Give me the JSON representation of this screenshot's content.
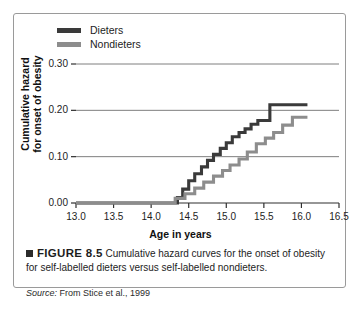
{
  "figure": {
    "number_label": "FIGURE 8.5",
    "caption_text": "Cumulative hazard curves for the onset of obesity for self-labelled dieters versus self-labelled nondieters.",
    "source_word": "Source:",
    "source_text": "From Stice et al., 1999",
    "marker_icon": "filled-square-icon"
  },
  "chart_data": {
    "type": "line",
    "title": "",
    "xlabel": "Age in years",
    "ylabel": "Cumulative hazard for onset of obesity",
    "ylabel_line1": "Cumulative hazard",
    "ylabel_line2": "for onset of obesity",
    "xlim": [
      13.0,
      16.5
    ],
    "ylim": [
      0.0,
      0.3
    ],
    "xticks": [
      13.0,
      13.5,
      14.0,
      14.5,
      15.0,
      15.5,
      16.0,
      16.5
    ],
    "xtick_labels": [
      "13.0",
      "13.5",
      "14.0",
      "14.5",
      "15.0",
      "15.5",
      "16.0",
      "16.5"
    ],
    "yticks": [
      0.0,
      0.1,
      0.2,
      0.3
    ],
    "ytick_labels": [
      "0.00",
      "0.10",
      "0.20",
      "0.30"
    ],
    "grid": "horizontal",
    "legend_position": "above-left",
    "step_style": "post",
    "series": [
      {
        "name": "Dieters",
        "color": "#3a3a3a",
        "x": [
          13.0,
          14.25,
          14.35,
          14.42,
          14.5,
          14.58,
          14.67,
          14.75,
          14.83,
          14.92,
          15.0,
          15.08,
          15.17,
          15.25,
          15.33,
          15.42,
          15.58,
          16.08
        ],
        "y": [
          0.0,
          0.0,
          0.012,
          0.03,
          0.048,
          0.063,
          0.078,
          0.092,
          0.105,
          0.118,
          0.13,
          0.143,
          0.152,
          0.16,
          0.17,
          0.178,
          0.212,
          0.212
        ]
      },
      {
        "name": "Nondieters",
        "color": "#8d8d8d",
        "x": [
          13.0,
          14.22,
          14.32,
          14.45,
          14.58,
          14.7,
          14.83,
          14.95,
          15.05,
          15.17,
          15.28,
          15.4,
          15.52,
          15.63,
          15.75,
          15.88,
          16.08
        ],
        "y": [
          0.0,
          0.0,
          0.01,
          0.02,
          0.032,
          0.045,
          0.058,
          0.07,
          0.082,
          0.095,
          0.11,
          0.128,
          0.14,
          0.152,
          0.168,
          0.185,
          0.185
        ]
      }
    ]
  }
}
